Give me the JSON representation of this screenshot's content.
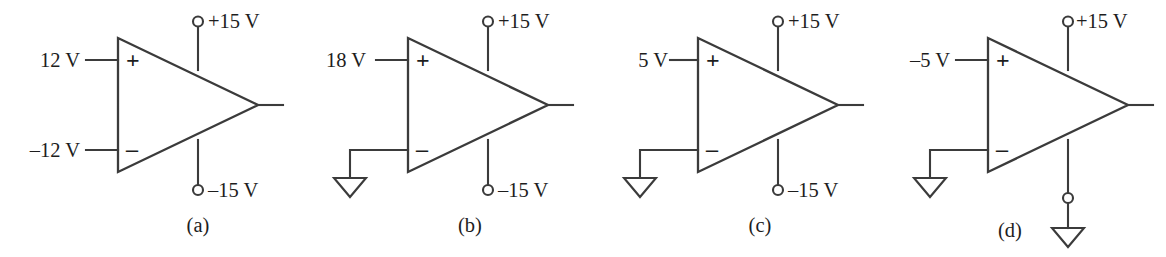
{
  "figure": {
    "line_color": "#3b3b3b",
    "text_color": "#1d1d1d",
    "background": "#ffffff"
  },
  "panels": [
    {
      "id": "a",
      "caption": "(a)",
      "plus_input_label": "12 V",
      "minus_input_label": "–12 V",
      "minus_input_type": "labeled",
      "plus_sign": "+",
      "minus_sign": "–",
      "top_supply_label": "+15 V",
      "top_supply_type": "terminal",
      "bottom_supply_label": "–15 V",
      "bottom_supply_type": "terminal"
    },
    {
      "id": "b",
      "caption": "(b)",
      "plus_input_label": "18 V",
      "minus_input_label": "",
      "minus_input_type": "ground",
      "plus_sign": "+",
      "minus_sign": "–",
      "top_supply_label": "+15 V",
      "top_supply_type": "terminal",
      "bottom_supply_label": "–15 V",
      "bottom_supply_type": "terminal"
    },
    {
      "id": "c",
      "caption": "(c)",
      "plus_input_label": "5 V",
      "minus_input_label": "",
      "minus_input_type": "ground",
      "plus_sign": "+",
      "minus_sign": "–",
      "top_supply_label": "+15 V",
      "top_supply_type": "terminal",
      "bottom_supply_label": "–15 V",
      "bottom_supply_type": "terminal"
    },
    {
      "id": "d",
      "caption": "(d)",
      "plus_input_label": "–5 V",
      "minus_input_label": "",
      "minus_input_type": "ground",
      "plus_sign": "+",
      "minus_sign": "–",
      "top_supply_label": "+15 V",
      "top_supply_type": "terminal",
      "bottom_supply_label": "",
      "bottom_supply_type": "terminal-ground"
    }
  ]
}
